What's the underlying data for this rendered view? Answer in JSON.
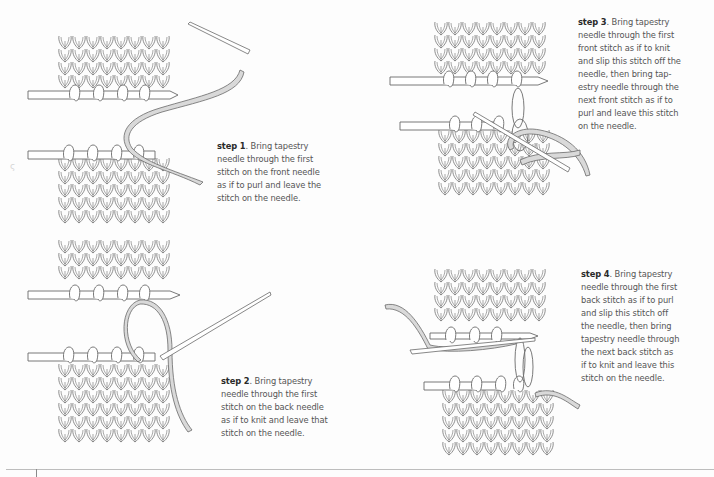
{
  "page": {
    "background": "#fdfdfd",
    "line_color": "#6e6e6e",
    "yarn_fill": "#d9d9d9",
    "text_color": "#555555",
    "label_color": "#2a2a2a",
    "margin_mark": "ς"
  },
  "steps": [
    {
      "id": "step1",
      "label": "step 1",
      "text": ". Bring tapestry needle through the first stitch on the front needle as if to purl and leave the stitch on the needle.",
      "lines": [
        "needle through the first",
        "stitch on the front needle",
        "as if to purl and leave the",
        "stitch on the needle."
      ],
      "first_line_rest": ". Bring tapestry"
    },
    {
      "id": "step2",
      "label": "step 2",
      "text": ". Bring tapestry needle through the first stitch on the back needle as if to knit and leave that stitch on the needle.",
      "lines": [
        "needle through the first",
        "stitch on the back needle",
        "as if to knit and leave that",
        "stitch on the needle."
      ],
      "first_line_rest": ". Bring tapestry"
    },
    {
      "id": "step3",
      "label": "step 3",
      "text": ". Bring tapestry needle through the first front stitch as if to knit and slip this stitch off the needle, then bring tap-estry needle through the next front stitch as if to purl and leave this stitch on the needle.",
      "lines": [
        "needle through the first",
        "front stitch as if to knit",
        "and slip this stitch off the",
        "needle, then bring tap-",
        "estry needle through the",
        "next front stitch as if to",
        "purl and leave this stitch",
        "on the needle."
      ],
      "first_line_rest": ". Bring tapestry"
    },
    {
      "id": "step4",
      "label": "step 4",
      "text": ". Bring tapestry needle through the first back stitch as if to purl and slip this stitch off the needle, then bring tapestry needle through the next back stitch as if to knit and leave this stitch on the needle.",
      "lines": [
        "needle through the first",
        "back stitch as if to purl",
        "and slip this stitch off",
        "the needle, then bring",
        "tapestry needle through",
        "the next back stitch as",
        "if to knit and leave this",
        "stitch on the needle."
      ],
      "first_line_rest": ". Bring tapestry"
    }
  ]
}
